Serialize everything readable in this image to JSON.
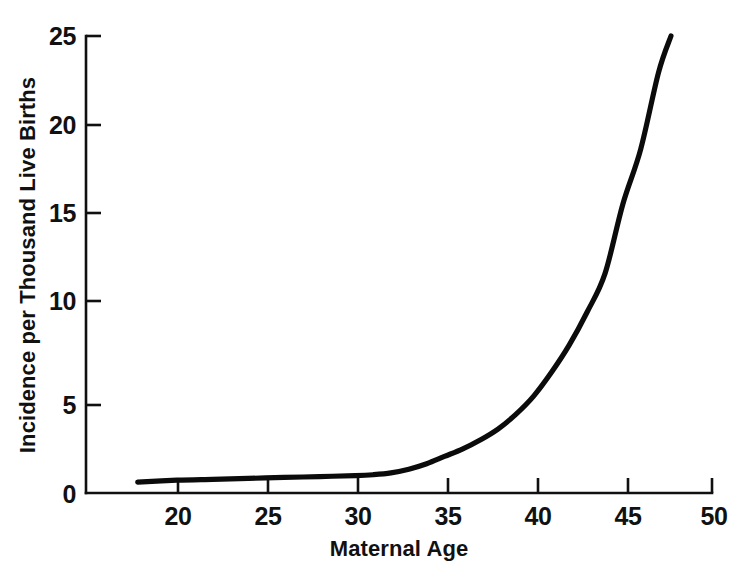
{
  "chart_data": {
    "type": "line",
    "title": "",
    "subtitle": "",
    "xlabel": "Maternal Age",
    "ylabel": "Incidence per Thousand Live Births",
    "xlim": [
      14.9,
      50
    ],
    "ylim": [
      0,
      25
    ],
    "grid": false,
    "legend": "none",
    "xticks": [
      20,
      25,
      30,
      35,
      40,
      45,
      50
    ],
    "xtick_labels": [
      "20",
      "25",
      "30",
      "35",
      "40",
      "45",
      "50"
    ],
    "yticks": [
      0,
      5,
      10,
      15,
      20,
      25
    ],
    "ytick_labels": [
      "0",
      "5",
      "10",
      "15",
      "20",
      "25"
    ],
    "series": [
      {
        "name": "Incidence",
        "x": [
          17.8,
          20,
          22,
          24,
          26,
          28,
          30,
          31,
          32,
          33,
          34,
          35,
          36,
          37,
          38,
          39,
          40,
          41,
          42,
          43,
          44,
          45,
          46,
          47,
          47.7
        ],
        "values": [
          0.6,
          0.7,
          0.75,
          0.8,
          0.85,
          0.9,
          0.95,
          1.0,
          1.1,
          1.3,
          1.6,
          2.0,
          2.4,
          2.9,
          3.5,
          4.3,
          5.3,
          6.6,
          8.1,
          9.9,
          12.0,
          15.8,
          18.8,
          23.0,
          25.0
        ]
      }
    ]
  },
  "axes": {
    "y_axis_label": "Incidence per Thousand Live Births",
    "x_axis_label": "Maternal Age",
    "y_tick_0": "0",
    "y_tick_5": "5",
    "y_tick_10": "10",
    "y_tick_15": "15",
    "y_tick_20": "20",
    "y_tick_25": "25",
    "x_tick_20": "20",
    "x_tick_25": "25",
    "x_tick_30": "30",
    "x_tick_35": "35",
    "x_tick_40": "40",
    "x_tick_45": "45",
    "x_tick_50": "50"
  },
  "colors": {
    "curve": "#0b0b0b",
    "axis": "#101010",
    "background": "#ffffff",
    "text": "#111111"
  }
}
